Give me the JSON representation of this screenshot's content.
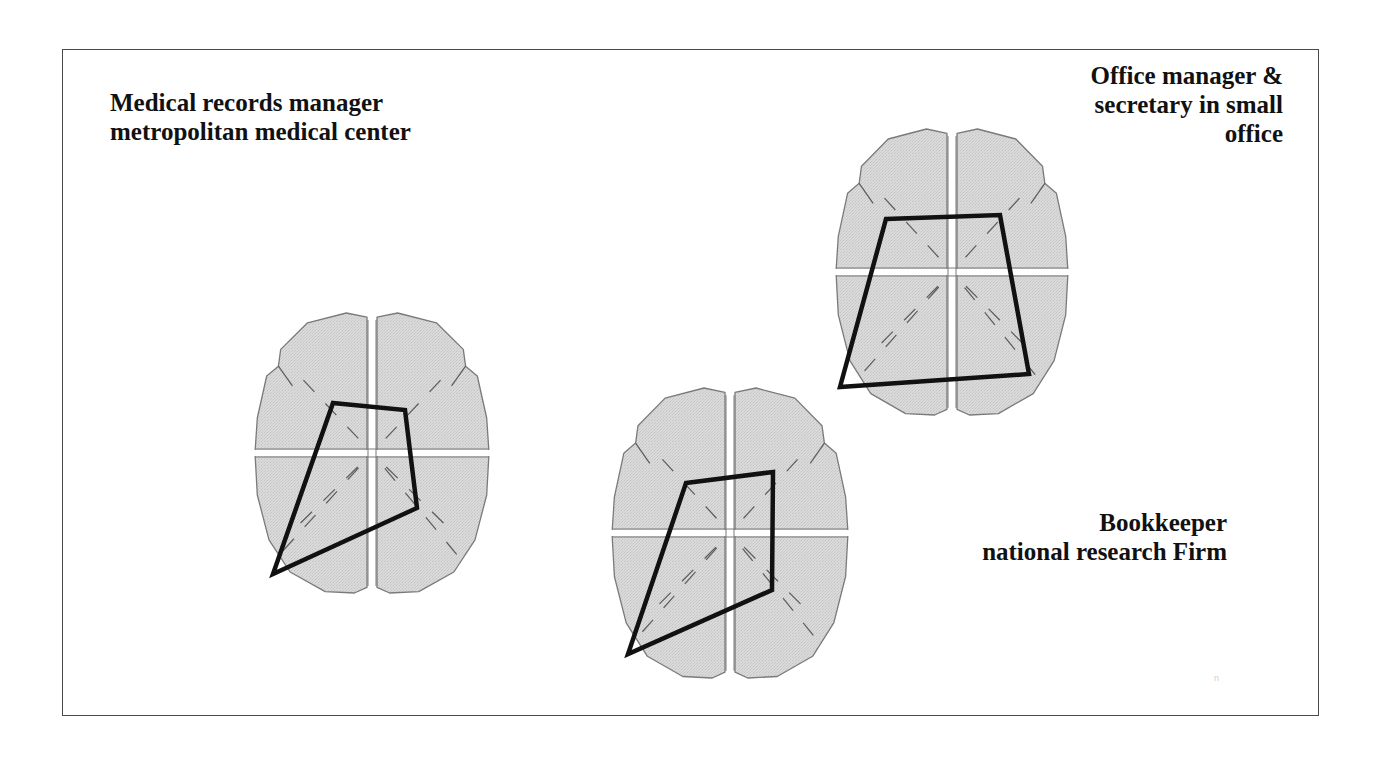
{
  "labels": {
    "medical_records": {
      "lines": [
        "Medical records manager",
        "metropolitan medical center"
      ]
    },
    "office_manager": {
      "lines": [
        "Office manager &",
        "secretary in small",
        "office"
      ]
    },
    "bookkeeper": {
      "lines": [
        "Bookkeeper",
        "national research Firm"
      ]
    }
  },
  "colors": {
    "brain_fill": "#d9d9d9",
    "brain_outline": "#7a7a7a",
    "polygon_stroke": "#111111",
    "frame": "#4a4a4a",
    "text": "#111111"
  },
  "brains": [
    {
      "id": "medical-records-manager",
      "center": [
        372,
        453
      ],
      "rx": 117,
      "ry": 140,
      "polygon": [
        [
          333,
          403
        ],
        [
          405,
          410
        ],
        [
          417,
          508
        ],
        [
          273,
          574
        ]
      ]
    },
    {
      "id": "bookkeeper",
      "center": [
        730,
        533
      ],
      "rx": 118,
      "ry": 145,
      "polygon": [
        [
          686,
          483
        ],
        [
          773,
          472
        ],
        [
          772,
          590
        ],
        [
          628,
          654
        ]
      ]
    },
    {
      "id": "office-manager",
      "center": [
        952,
        272
      ],
      "rx": 116,
      "ry": 143,
      "polygon": [
        [
          886,
          219
        ],
        [
          1000,
          215
        ],
        [
          1029,
          374
        ],
        [
          840,
          387
        ]
      ]
    }
  ],
  "faint_mark": "n"
}
